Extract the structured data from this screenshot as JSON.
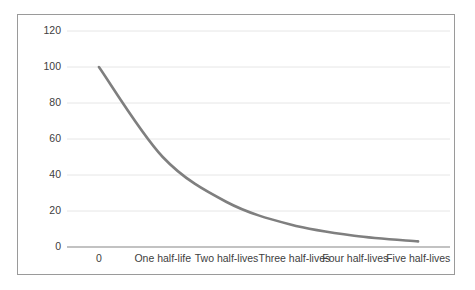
{
  "chart_data": {
    "type": "line",
    "title": "",
    "subtitle": "",
    "xlabel": "",
    "ylabel": "",
    "categories": [
      "0",
      "One half-life",
      "Two half-lives",
      "Three half-lives",
      "Four half-lives",
      "Five half-lives"
    ],
    "values": [
      100,
      50,
      25,
      12.5,
      6.25,
      3.125
    ],
    "series": [
      {
        "name": "Amount remaining",
        "values": [
          100,
          50,
          25,
          12.5,
          6.25,
          3.125
        ]
      }
    ],
    "ylim": [
      0,
      120
    ],
    "yticks": [
      0,
      20,
      40,
      60,
      80,
      100,
      120
    ],
    "ytick_labels": [
      "0",
      "20",
      "40",
      "60",
      "80",
      "100",
      "120"
    ],
    "grid": true,
    "grid_axis": "y",
    "legend": false,
    "legend_position": "none",
    "line_color": "#7f7f7f",
    "grid_color": "#e6e6e6",
    "axis_color": "#868686",
    "border_color": "#9a9a9a",
    "tick_label_color": "#404040",
    "background_color": "#ffffff",
    "annotations": []
  }
}
